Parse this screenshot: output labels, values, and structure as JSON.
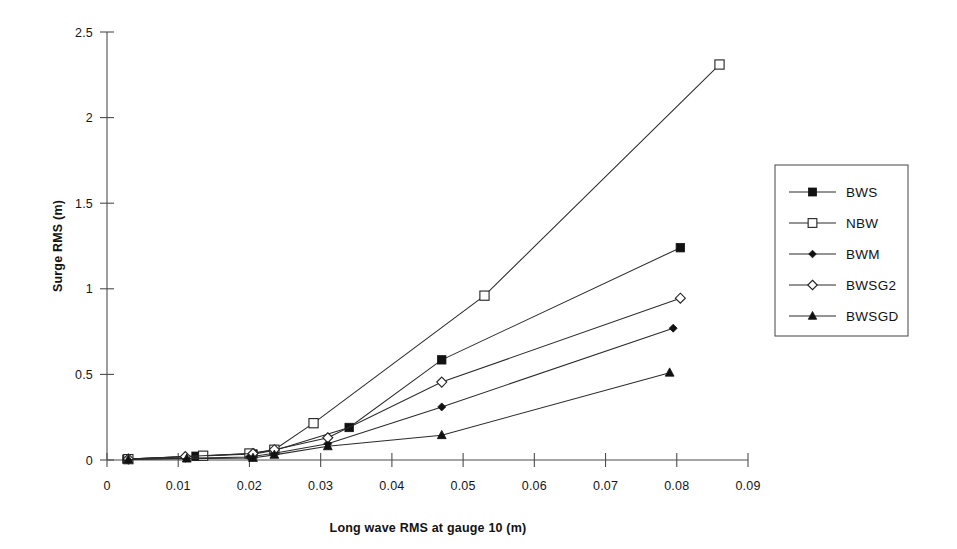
{
  "chart_data": {
    "type": "line",
    "title": "",
    "xlabel": "Long wave RMS at gauge 10 (m)",
    "ylabel": "Surge RMS (m)",
    "xlim": [
      0,
      0.09
    ],
    "ylim": [
      0,
      2.5
    ],
    "xticks": [
      0,
      0.01,
      0.02,
      0.03,
      0.04,
      0.05,
      0.06,
      0.07,
      0.08,
      0.09
    ],
    "xtick_labels": [
      "0",
      "0.01",
      "0.02",
      "0.03",
      "0.04",
      "0.05",
      "0.06",
      "0.07",
      "0.08",
      "0.09"
    ],
    "yticks": [
      0,
      0.5,
      1,
      1.5,
      2,
      2.5
    ],
    "ytick_labels": [
      "0",
      "0.5",
      "1",
      "1.5",
      "2",
      "2.5"
    ],
    "grid": false,
    "legend_position": "right",
    "series": [
      {
        "name": "BWS",
        "marker": "filled-square",
        "color": "#111111",
        "points": [
          [
            0.0028,
            0.005
          ],
          [
            0.0125,
            0.022
          ],
          [
            0.0205,
            0.035
          ],
          [
            0.0235,
            0.055
          ],
          [
            0.034,
            0.19
          ],
          [
            0.047,
            0.585
          ],
          [
            0.0805,
            1.24
          ]
        ]
      },
      {
        "name": "NBW",
        "marker": "open-square",
        "color": "#222222",
        "points": [
          [
            0.003,
            0.005
          ],
          [
            0.0135,
            0.025
          ],
          [
            0.02,
            0.038
          ],
          [
            0.0235,
            0.06
          ],
          [
            0.029,
            0.215
          ],
          [
            0.053,
            0.96
          ],
          [
            0.086,
            2.31
          ]
        ]
      },
      {
        "name": "BWM",
        "marker": "filled-diamond",
        "color": "#111111",
        "points": [
          [
            0.0028,
            0.004
          ],
          [
            0.011,
            0.01
          ],
          [
            0.02,
            0.018
          ],
          [
            0.0235,
            0.04
          ],
          [
            0.031,
            0.095
          ],
          [
            0.047,
            0.31
          ],
          [
            0.0795,
            0.77
          ]
        ]
      },
      {
        "name": "BWSG2",
        "marker": "open-diamond",
        "color": "#222222",
        "points": [
          [
            0.003,
            0.006
          ],
          [
            0.011,
            0.02
          ],
          [
            0.0205,
            0.038
          ],
          [
            0.0235,
            0.06
          ],
          [
            0.031,
            0.13
          ],
          [
            0.047,
            0.455
          ],
          [
            0.0805,
            0.945
          ]
        ]
      },
      {
        "name": "BWSGD",
        "marker": "filled-triangle",
        "color": "#111111",
        "points": [
          [
            0.003,
            0.003
          ],
          [
            0.0112,
            0.008
          ],
          [
            0.0205,
            0.012
          ],
          [
            0.0235,
            0.03
          ],
          [
            0.031,
            0.08
          ],
          [
            0.047,
            0.145
          ],
          [
            0.079,
            0.51
          ]
        ]
      }
    ]
  },
  "legend": {
    "entries": [
      {
        "label": "BWS",
        "marker": "filled-square"
      },
      {
        "label": "NBW",
        "marker": "open-square"
      },
      {
        "label": "BWM",
        "marker": "filled-diamond"
      },
      {
        "label": "BWSG2",
        "marker": "open-diamond"
      },
      {
        "label": "BWSGD",
        "marker": "filled-triangle"
      }
    ]
  }
}
